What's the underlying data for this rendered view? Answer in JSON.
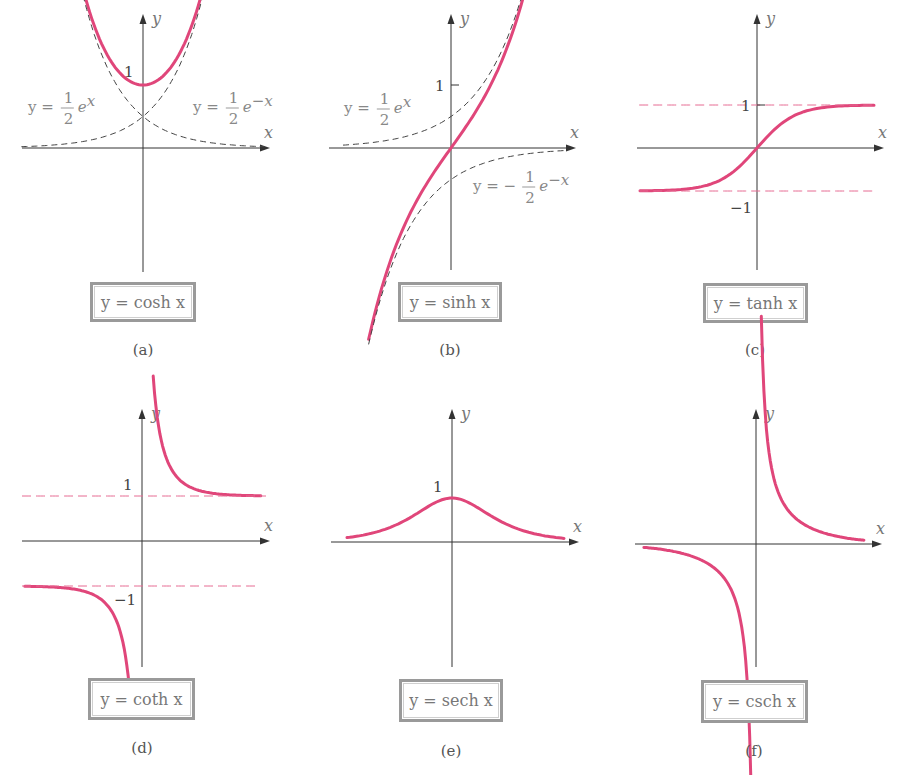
{
  "figure": {
    "curve_color": "#e0467a",
    "asymptote_pink": "#e66a92",
    "axis_color": "#333333"
  },
  "chart_data": [
    {
      "id": "a",
      "type": "line",
      "title": "y = cosh x",
      "caption": "(a)",
      "xlabel": "x",
      "ylabel": "y",
      "tick_labels": [
        {
          "axis": "y",
          "value": 1,
          "text": "1"
        }
      ],
      "series": [
        {
          "name": "cosh x",
          "style": "solid-pink",
          "fn": "cosh",
          "x": [
            -2.5,
            -2,
            -1.5,
            -1,
            -0.5,
            0,
            0.5,
            1,
            1.5,
            2,
            2.5
          ],
          "values": [
            6.13,
            3.76,
            2.35,
            1.54,
            1.13,
            1.0,
            1.13,
            1.54,
            2.35,
            3.76,
            6.13
          ]
        },
        {
          "name": "y = 1/2 e^x",
          "style": "dashed-dark",
          "fn": "halfexp"
        },
        {
          "name": "y = 1/2 e^-x",
          "style": "dashed-dark",
          "fn": "halfexpneg"
        }
      ],
      "annotations": [
        {
          "text_main": "y = ",
          "num": "1",
          "den": "2",
          "tail": "e",
          "sup": "x"
        },
        {
          "text_main": "y = ",
          "num": "1",
          "den": "2",
          "tail": "e",
          "sup": "−x"
        }
      ],
      "label_box": "y = cosh x",
      "grid": false
    },
    {
      "id": "b",
      "type": "line",
      "title": "y = sinh x",
      "caption": "(b)",
      "xlabel": "x",
      "ylabel": "y",
      "tick_labels": [
        {
          "axis": "y",
          "value": 1,
          "text": "1"
        }
      ],
      "series": [
        {
          "name": "sinh x",
          "style": "solid-pink",
          "fn": "sinh",
          "x": [
            -2,
            -1.5,
            -1,
            -0.5,
            0,
            0.5,
            1,
            1.5,
            2
          ],
          "values": [
            -3.63,
            -2.13,
            -1.18,
            -0.52,
            0,
            0.52,
            1.18,
            2.13,
            3.63
          ]
        },
        {
          "name": "y = 1/2 e^x",
          "style": "dashed-dark",
          "fn": "halfexp"
        },
        {
          "name": "y = -1/2 e^-x",
          "style": "dashed-dark",
          "fn": "neghalfexpneg"
        }
      ],
      "annotations": [
        {
          "text_main": "y = ",
          "num": "1",
          "den": "2",
          "tail": "e",
          "sup": "x"
        },
        {
          "text_main": "y = − ",
          "num": "1",
          "den": "2",
          "tail": "e",
          "sup": "−x"
        }
      ],
      "label_box": "y = sinh x",
      "grid": false
    },
    {
      "id": "c",
      "type": "line",
      "title": "y = tanh x",
      "caption": "(c)",
      "xlabel": "x",
      "ylabel": "y",
      "tick_labels": [
        {
          "axis": "y",
          "value": 1,
          "text": "1"
        },
        {
          "axis": "y",
          "value": -1,
          "text": "−1"
        }
      ],
      "series": [
        {
          "name": "tanh x",
          "style": "solid-pink",
          "fn": "tanh",
          "x": [
            -3,
            -2,
            -1,
            0,
            1,
            2,
            3
          ],
          "values": [
            -0.995,
            -0.964,
            -0.762,
            0,
            0.762,
            0.964,
            0.995
          ]
        },
        {
          "name": "y = 1",
          "style": "dashed-pink",
          "fn": "one"
        },
        {
          "name": "y = -1",
          "style": "dashed-pink",
          "fn": "negone"
        }
      ],
      "label_box": "y = tanh x",
      "grid": false
    },
    {
      "id": "d",
      "type": "line",
      "title": "y = coth x",
      "caption": "(d)",
      "xlabel": "x",
      "ylabel": "y",
      "tick_labels": [
        {
          "axis": "y",
          "value": 1,
          "text": "1"
        },
        {
          "axis": "y",
          "value": -1,
          "text": "−1"
        }
      ],
      "series": [
        {
          "name": "coth x (x>0)",
          "style": "solid-pink",
          "fn": "coth",
          "x": [
            0.28,
            0.5,
            1,
            2,
            3
          ],
          "values": [
            3.66,
            2.16,
            1.31,
            1.04,
            1.005
          ]
        },
        {
          "name": "coth x (x<0)",
          "style": "solid-pink",
          "fn": "coth",
          "x": [
            -3,
            -2,
            -1,
            -0.5,
            -0.28
          ],
          "values": [
            -1.005,
            -1.04,
            -1.31,
            -2.16,
            -3.66
          ]
        },
        {
          "name": "y = 1",
          "style": "dashed-pink",
          "fn": "one"
        },
        {
          "name": "y = -1",
          "style": "dashed-pink",
          "fn": "negone"
        }
      ],
      "label_box": "y = coth x",
      "grid": false
    },
    {
      "id": "e",
      "type": "line",
      "title": "y = sech x",
      "caption": "(e)",
      "xlabel": "x",
      "ylabel": "y",
      "tick_labels": [
        {
          "axis": "y",
          "value": 1,
          "text": "1"
        }
      ],
      "series": [
        {
          "name": "sech x",
          "style": "solid-pink",
          "fn": "sech",
          "x": [
            -3,
            -2,
            -1,
            0,
            1,
            2,
            3
          ],
          "values": [
            0.099,
            0.266,
            0.648,
            1.0,
            0.648,
            0.266,
            0.099
          ]
        }
      ],
      "label_box": "y = sech x",
      "grid": false
    },
    {
      "id": "f",
      "type": "line",
      "title": "y = csch x",
      "caption": "(f)",
      "xlabel": "x",
      "ylabel": "y",
      "tick_labels": [],
      "series": [
        {
          "name": "csch x (x>0)",
          "style": "solid-pink",
          "fn": "csch",
          "x": [
            0.16,
            0.5,
            1,
            2,
            3
          ],
          "values": [
            6.2,
            1.92,
            0.85,
            0.28,
            0.1
          ]
        },
        {
          "name": "csch x (x<0)",
          "style": "solid-pink",
          "fn": "csch",
          "x": [
            -3,
            -2,
            -1,
            -0.5,
            -0.16
          ],
          "values": [
            -0.1,
            -0.28,
            -0.85,
            -1.92,
            -6.2
          ]
        }
      ],
      "label_box": "y = csch x",
      "grid": false
    }
  ]
}
